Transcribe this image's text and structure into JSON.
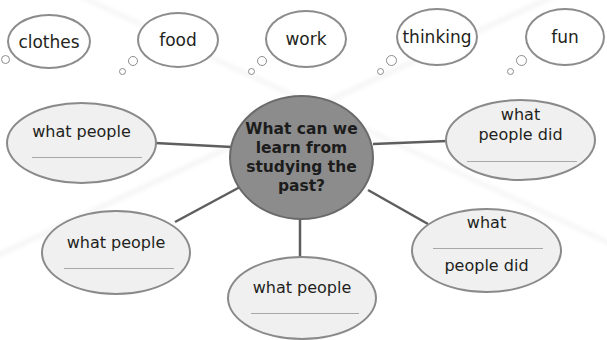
{
  "thought_bubbles": [
    {
      "label": "clothes"
    },
    {
      "label": "food"
    },
    {
      "label": "work"
    },
    {
      "label": "thinking"
    },
    {
      "label": "fun"
    }
  ],
  "center": {
    "question": "What can we learn from studying the past?"
  },
  "nodes": [
    {
      "id": "left-top",
      "text": "what people",
      "blank": "______"
    },
    {
      "id": "right-top",
      "text_line1": "what",
      "text_line2": "people did",
      "blank": "______"
    },
    {
      "id": "left-bottom",
      "text": "what people",
      "blank": "______"
    },
    {
      "id": "bottom",
      "text": "what people",
      "blank": "______"
    },
    {
      "id": "right-bottom",
      "text_line1": "what",
      "text_line2": "people did",
      "blank": "______"
    }
  ],
  "colors": {
    "center_fill": "#8c8c8c",
    "node_fill": "#f0f0f0",
    "outline": "#8a8a8a",
    "connector": "#5e5e5e"
  }
}
